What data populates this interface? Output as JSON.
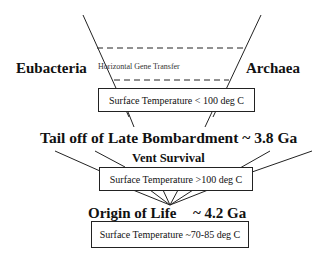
{
  "diagram": {
    "labels": {
      "eubacteria": "Eubacteria",
      "archaea": "Archaea",
      "hgt": "Horizontal Gene Transfer",
      "tail_off": "Tail off of Late Bombardment ~ 3.8 Ga",
      "vent": "Vent Survival",
      "origin": "Origin of Life",
      "origin_age": "~ 4.2 Ga"
    },
    "boxes": {
      "temp_low": "Surface Temperature < 100 deg C",
      "temp_high": "Surface Temperature  >100 deg C",
      "temp_origin": "Surface Temperature  ~70-85 deg C"
    }
  }
}
